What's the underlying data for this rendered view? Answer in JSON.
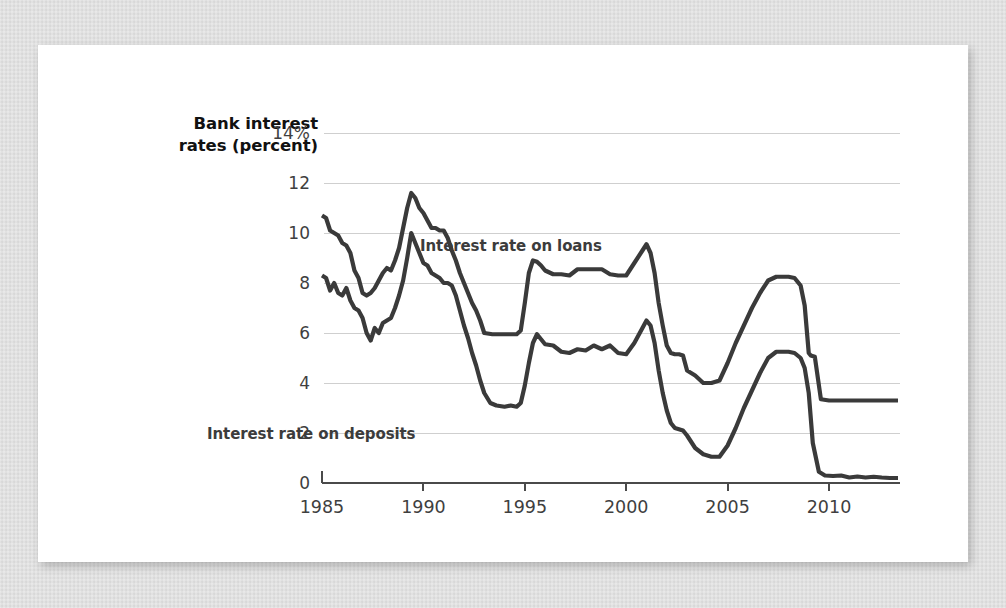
{
  "card": {
    "background_color": "#ffffff",
    "page_background_color": "#d8d8d8"
  },
  "axis_title": {
    "line1": "Bank interest",
    "line2": "rates (percent)"
  },
  "labels": {
    "loans": "Interest rate on loans",
    "deposits": "Interest rate on deposits"
  },
  "chart_data": {
    "type": "line",
    "title": "Bank interest rates (percent)",
    "xlabel": "",
    "ylabel": "Bank interest rates (percent)",
    "xlim": [
      1985,
      2013.5
    ],
    "ylim": [
      0,
      14
    ],
    "xticks": [
      1985,
      1990,
      1995,
      2000,
      2005,
      2010
    ],
    "xtick_labels": [
      "1985",
      "1990",
      "1995",
      "2000",
      "2005",
      "2010"
    ],
    "yticks": [
      0,
      2,
      4,
      6,
      8,
      10,
      12,
      14
    ],
    "ytick_labels": [
      "0",
      "2",
      "4",
      "6",
      "8",
      "10",
      "12",
      "14%"
    ],
    "grid": true,
    "grid_axis": "y",
    "legend": "inline-annotations",
    "line_color": "#3a3a3a",
    "annotations": [
      {
        "text": "Interest rate on loans",
        "x": 2001.2,
        "y": 9.0
      },
      {
        "text": "Interest rate on deposits",
        "x": 1993.4,
        "y": 1.85
      }
    ],
    "series": [
      {
        "name": "Interest rate on loans",
        "x": [
          1985.0,
          1985.2,
          1985.4,
          1985.6,
          1985.8,
          1986.0,
          1986.2,
          1986.4,
          1986.6,
          1986.8,
          1987.0,
          1987.2,
          1987.4,
          1987.6,
          1987.8,
          1988.0,
          1988.2,
          1988.4,
          1988.6,
          1988.8,
          1989.0,
          1989.2,
          1989.4,
          1989.6,
          1989.8,
          1990.0,
          1990.2,
          1990.4,
          1990.6,
          1990.8,
          1991.0,
          1991.2,
          1991.4,
          1991.6,
          1991.8,
          1992.0,
          1992.2,
          1992.4,
          1992.6,
          1992.8,
          1993.0,
          1993.4,
          1993.8,
          1994.2,
          1994.6,
          1994.8,
          1995.0,
          1995.2,
          1995.4,
          1995.6,
          1995.8,
          1996.0,
          1996.4,
          1996.8,
          1997.2,
          1997.6,
          1998.0,
          1998.4,
          1998.8,
          1999.2,
          1999.6,
          2000.0,
          2000.4,
          2000.8,
          2001.0,
          2001.2,
          2001.4,
          2001.6,
          2001.8,
          2002.0,
          2002.2,
          2002.4,
          2002.6,
          2002.8,
          2003.0,
          2003.4,
          2003.8,
          2004.2,
          2004.6,
          2005.0,
          2005.4,
          2005.8,
          2006.2,
          2006.6,
          2007.0,
          2007.4,
          2007.8,
          2008.0,
          2008.3,
          2008.6,
          2008.8,
          2009.0,
          2009.1,
          2009.3,
          2009.6,
          2010.0,
          2010.5,
          2011.0,
          2011.5,
          2012.0,
          2012.5,
          2013.0,
          2013.4
        ],
        "y": [
          10.7,
          10.6,
          10.1,
          10.0,
          9.9,
          9.6,
          9.5,
          9.2,
          8.5,
          8.2,
          7.6,
          7.5,
          7.6,
          7.8,
          8.1,
          8.4,
          8.6,
          8.5,
          8.9,
          9.4,
          10.2,
          11.0,
          11.6,
          11.4,
          11.0,
          10.8,
          10.5,
          10.2,
          10.2,
          10.1,
          10.1,
          9.8,
          9.3,
          8.9,
          8.4,
          8.0,
          7.6,
          7.2,
          6.9,
          6.5,
          6.0,
          5.95,
          5.95,
          5.95,
          5.95,
          6.1,
          7.2,
          8.4,
          8.9,
          8.85,
          8.7,
          8.5,
          8.35,
          8.35,
          8.3,
          8.55,
          8.55,
          8.55,
          8.55,
          8.35,
          8.3,
          8.3,
          8.8,
          9.3,
          9.55,
          9.2,
          8.4,
          7.2,
          6.3,
          5.5,
          5.2,
          5.15,
          5.15,
          5.1,
          4.5,
          4.3,
          4.0,
          4.0,
          4.1,
          4.8,
          5.6,
          6.3,
          7.0,
          7.6,
          8.1,
          8.25,
          8.25,
          8.25,
          8.2,
          7.9,
          7.1,
          5.2,
          5.1,
          5.05,
          3.35,
          3.3,
          3.3,
          3.3,
          3.3,
          3.3,
          3.3,
          3.3,
          3.3
        ]
      },
      {
        "name": "Interest rate on deposits",
        "x": [
          1985.0,
          1985.2,
          1985.4,
          1985.6,
          1985.8,
          1986.0,
          1986.2,
          1986.4,
          1986.6,
          1986.8,
          1987.0,
          1987.2,
          1987.4,
          1987.6,
          1987.8,
          1988.0,
          1988.2,
          1988.4,
          1988.6,
          1988.8,
          1989.0,
          1989.2,
          1989.4,
          1989.6,
          1989.8,
          1990.0,
          1990.2,
          1990.4,
          1990.6,
          1990.8,
          1991.0,
          1991.2,
          1991.4,
          1991.6,
          1991.8,
          1992.0,
          1992.2,
          1992.4,
          1992.6,
          1992.8,
          1993.0,
          1993.3,
          1993.6,
          1994.0,
          1994.3,
          1994.6,
          1994.8,
          1995.0,
          1995.2,
          1995.4,
          1995.6,
          1995.8,
          1996.0,
          1996.4,
          1996.8,
          1997.2,
          1997.6,
          1998.0,
          1998.4,
          1998.8,
          1999.2,
          1999.6,
          2000.0,
          2000.4,
          2000.8,
          2001.0,
          2001.2,
          2001.4,
          2001.6,
          2001.8,
          2002.0,
          2002.2,
          2002.4,
          2002.6,
          2002.8,
          2003.0,
          2003.4,
          2003.8,
          2004.2,
          2004.6,
          2005.0,
          2005.4,
          2005.8,
          2006.2,
          2006.6,
          2007.0,
          2007.4,
          2007.8,
          2008.0,
          2008.3,
          2008.6,
          2008.8,
          2009.0,
          2009.2,
          2009.5,
          2009.8,
          2010.2,
          2010.6,
          2011.0,
          2011.4,
          2011.8,
          2012.2,
          2012.6,
          2013.0,
          2013.4
        ],
        "y": [
          8.3,
          8.2,
          7.7,
          8.0,
          7.6,
          7.5,
          7.8,
          7.3,
          7.0,
          6.9,
          6.6,
          6.0,
          5.7,
          6.2,
          6.0,
          6.4,
          6.5,
          6.6,
          7.0,
          7.5,
          8.1,
          9.0,
          10.0,
          9.6,
          9.2,
          8.8,
          8.7,
          8.4,
          8.3,
          8.2,
          8.0,
          8.0,
          7.9,
          7.5,
          6.9,
          6.3,
          5.8,
          5.2,
          4.7,
          4.1,
          3.6,
          3.2,
          3.1,
          3.05,
          3.1,
          3.05,
          3.2,
          3.9,
          4.8,
          5.6,
          5.95,
          5.75,
          5.55,
          5.5,
          5.25,
          5.2,
          5.35,
          5.3,
          5.5,
          5.35,
          5.5,
          5.2,
          5.15,
          5.6,
          6.2,
          6.5,
          6.3,
          5.6,
          4.5,
          3.6,
          2.9,
          2.4,
          2.2,
          2.15,
          2.1,
          1.9,
          1.4,
          1.15,
          1.05,
          1.05,
          1.5,
          2.2,
          3.0,
          3.7,
          4.4,
          5.0,
          5.25,
          5.25,
          5.25,
          5.2,
          5.0,
          4.6,
          3.6,
          1.6,
          0.45,
          0.3,
          0.28,
          0.3,
          0.22,
          0.26,
          0.22,
          0.25,
          0.22,
          0.2,
          0.2
        ]
      }
    ]
  }
}
